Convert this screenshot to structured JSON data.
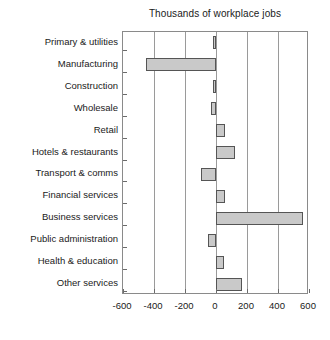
{
  "chart_data": {
    "type": "bar",
    "orientation": "horizontal",
    "title": "Thousands of workplace jobs",
    "xlabel": "",
    "ylabel": "",
    "xlim": [
      -600,
      600
    ],
    "xticks": [
      -600,
      -400,
      -200,
      0,
      200,
      400,
      600
    ],
    "xtick_labels": [
      "-600",
      "-400",
      "-200",
      "0",
      "200",
      "400",
      "600"
    ],
    "grid": true,
    "legend": false,
    "bar_fill_color": "#c9c9c9",
    "bar_edge_color": "#555555",
    "categories": [
      "Primary & utilities",
      "Manufacturing",
      "Construction",
      "Wholesale",
      "Retail",
      "Hotels & restaurants",
      "Transport & comms",
      "Financial services",
      "Business services",
      "Public administration",
      "Health & education",
      "Other services"
    ],
    "values": [
      -20,
      -450,
      -20,
      -35,
      60,
      120,
      -100,
      55,
      560,
      -50,
      50,
      170
    ]
  }
}
